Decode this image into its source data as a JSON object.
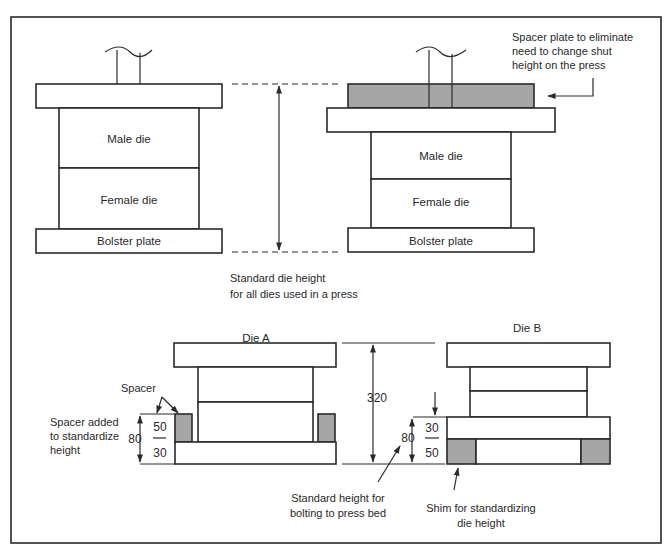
{
  "figure": {
    "top_left": {
      "male_die": "Male die",
      "female_die": "Female die",
      "bolster_plate": "Bolster plate"
    },
    "top_right": {
      "male_die": "Male die",
      "female_die": "Female die",
      "bolster_plate": "Bolster plate",
      "spacer_note": [
        "Spacer plate to eliminate",
        "need to change shut",
        "height on the press"
      ]
    },
    "standard_height_note": [
      "Standard die height",
      "for all dies used in a press"
    ],
    "die_a": {
      "title": "Die A",
      "spacer_label": "Spacer",
      "note": [
        "Spacer added",
        "to standardize",
        "height"
      ],
      "total": "80",
      "upper": "50",
      "lower": "30"
    },
    "die_b": {
      "title": "Die B",
      "total": "80",
      "upper": "30",
      "lower": "50",
      "shim_note": [
        "Shim for standardizing",
        "die height"
      ]
    },
    "standard_die_height_value": "320",
    "bolting_note": [
      "Standard height for",
      "bolting to press bed"
    ],
    "colors": {
      "line": "#2a2a2a",
      "shaded": "#a6a6a6",
      "background": "#ffffff"
    }
  }
}
